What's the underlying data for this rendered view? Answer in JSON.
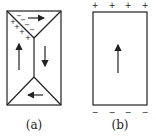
{
  "panels": [
    {
      "label": "(a)",
      "description": "Magnetic domains with closure domains",
      "surface_charges_top_left": [
        "+",
        "+",
        "+",
        "+",
        "-",
        "-",
        "-",
        "-"
      ]
    },
    {
      "label": "(b)",
      "description": "Single domain with surface charges",
      "top_charges": [
        "+",
        "+",
        "+",
        "+"
      ],
      "bottom_charges": [
        "−",
        "−",
        "−",
        "−"
      ]
    }
  ],
  "colors": {
    "stroke": "#222222",
    "background": "#ffffff"
  }
}
